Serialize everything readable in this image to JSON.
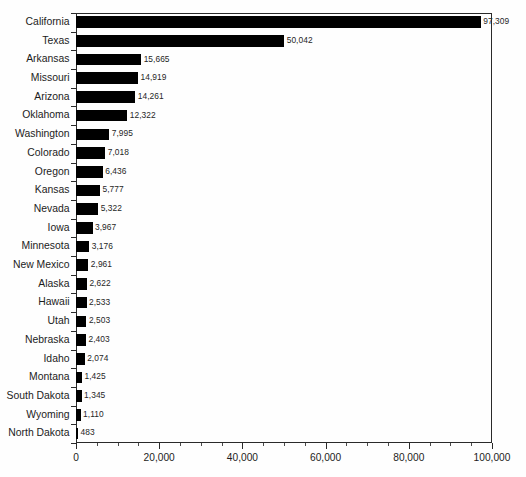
{
  "chart_data": {
    "type": "bar",
    "orientation": "horizontal",
    "title": "",
    "subtitle": "",
    "xlabel": "",
    "ylabel": "",
    "xlim": [
      0,
      100000
    ],
    "ylim": null,
    "grid": false,
    "legend": null,
    "bar_color": "#000000",
    "axis_color": "#2a2a2a",
    "background": "#ffffff",
    "x_major_ticks": [
      0,
      20000,
      40000,
      60000,
      80000,
      100000
    ],
    "x_tick_labels": [
      "0",
      "20,000",
      "40,000",
      "60,000",
      "80,000",
      "100,000"
    ],
    "x_minor_step": 5000,
    "categories": [
      "California",
      "Texas",
      "Arkansas",
      "Missouri",
      "Arizona",
      "Oklahoma",
      "Washington",
      "Colorado",
      "Oregon",
      "Kansas",
      "Nevada",
      "Iowa",
      "Minnesota",
      "New Mexico",
      "Alaska",
      "Hawaii",
      "Utah",
      "Nebraska",
      "Idaho",
      "Montana",
      "South Dakota",
      "Wyoming",
      "North Dakota"
    ],
    "values": [
      97309,
      50042,
      15665,
      14919,
      14261,
      12322,
      7995,
      7018,
      6436,
      5777,
      5322,
      3967,
      3176,
      2961,
      2622,
      2533,
      2503,
      2403,
      2074,
      1425,
      1345,
      1110,
      483
    ],
    "value_labels": [
      "97,309",
      "50,042",
      "15,665",
      "14,919",
      "14,261",
      "12,322",
      "7,995",
      "7,018",
      "6,436",
      "5,777",
      "5,322",
      "3,967",
      "3,176",
      "2,961",
      "2,622",
      "2,533",
      "2,503",
      "2,403",
      "2,074",
      "1,425",
      "1,345",
      "1,110",
      "483"
    ]
  },
  "footer": {
    "note": ""
  }
}
